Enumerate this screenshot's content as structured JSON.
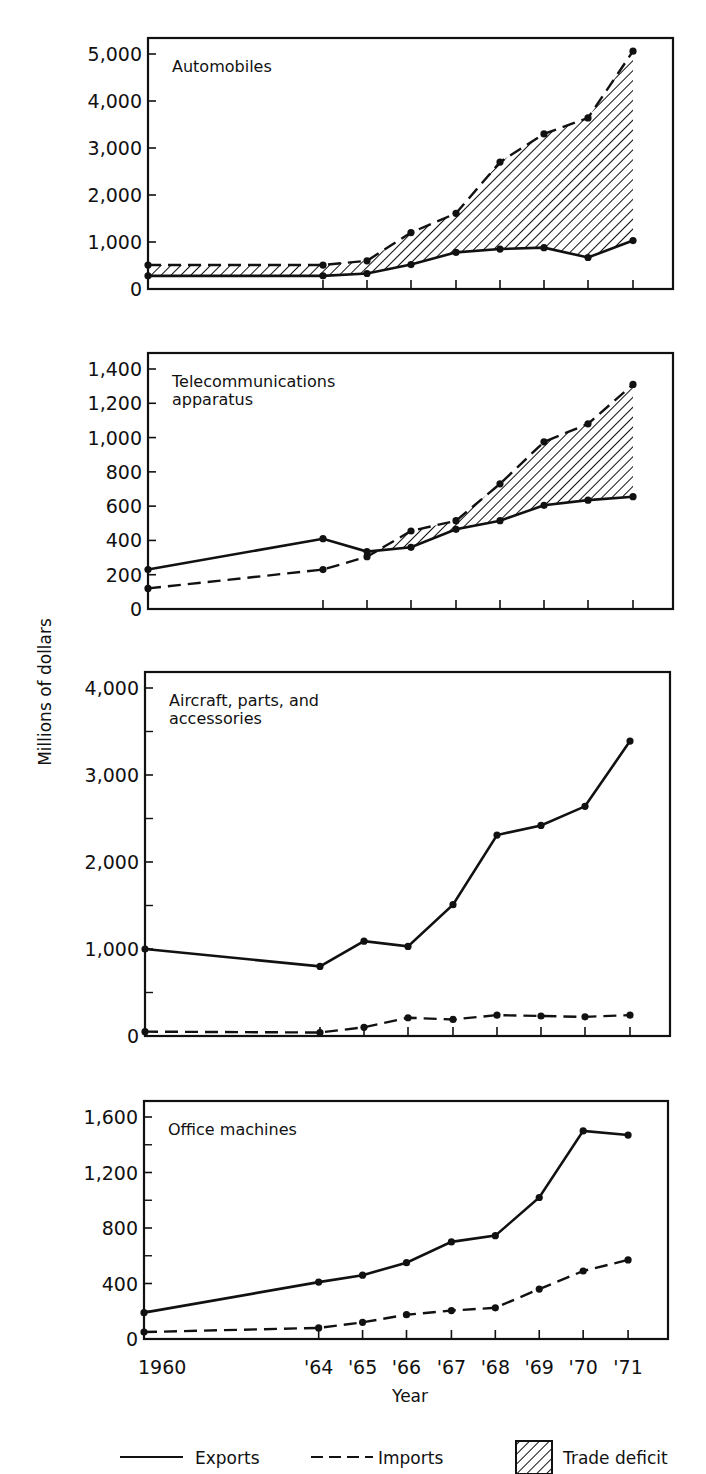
{
  "figure": {
    "ylabel": "Millions of dollars",
    "xlabel": "Year",
    "x_tick_labels": [
      "1960",
      "'64",
      "'65",
      "'66",
      "'67",
      "'68",
      "'69",
      "'70",
      "'71"
    ],
    "legend": {
      "exports": "Exports",
      "imports": "Imports",
      "deficit": "Trade deficit"
    }
  },
  "chart_data": [
    {
      "type": "line",
      "title": "Automobiles",
      "xlabel": "Year",
      "ylabel": "Millions of dollars",
      "x": [
        1960,
        1964,
        1965,
        1966,
        1967,
        1968,
        1969,
        1970,
        1971
      ],
      "ylim": [
        0,
        5000
      ],
      "yticks": [
        0,
        1000,
        2000,
        3000,
        4000,
        5000
      ],
      "ytick_labels": [
        "0",
        "1,000",
        "2,000",
        "3,000",
        "4,000",
        "5,000"
      ],
      "minor_yticks": [],
      "shade_deficit": true,
      "series": [
        {
          "name": "Exports",
          "style": "solid",
          "values": [
            280,
            280,
            330,
            520,
            780,
            850,
            880,
            670,
            1030
          ]
        },
        {
          "name": "Imports",
          "style": "dashed",
          "values": [
            510,
            510,
            600,
            1200,
            1610,
            2700,
            3300,
            3640,
            5060
          ]
        }
      ]
    },
    {
      "type": "line",
      "title": "Telecommunications apparatus",
      "title_lines": [
        "Telecommunications",
        "apparatus"
      ],
      "xlabel": "Year",
      "ylabel": "Millions of dollars",
      "x": [
        1960,
        1964,
        1965,
        1966,
        1967,
        1968,
        1969,
        1970,
        1971
      ],
      "ylim": [
        0,
        1400
      ],
      "yticks": [
        0,
        200,
        400,
        600,
        800,
        1000,
        1200,
        1400
      ],
      "ytick_labels": [
        "0",
        "200",
        "400",
        "600",
        "800",
        "1,000",
        "1,200",
        "1,400"
      ],
      "minor_yticks": [],
      "shade_deficit": true,
      "series": [
        {
          "name": "Exports",
          "style": "solid",
          "values": [
            230,
            410,
            335,
            360,
            465,
            515,
            605,
            635,
            655
          ]
        },
        {
          "name": "Imports",
          "style": "dashed",
          "values": [
            120,
            230,
            305,
            455,
            515,
            730,
            975,
            1080,
            1310
          ]
        }
      ]
    },
    {
      "type": "line",
      "title": "Aircraft, parts, and accessories",
      "title_lines": [
        "Aircraft, parts, and",
        "accessories"
      ],
      "xlabel": "Year",
      "ylabel": "Millions of dollars",
      "x": [
        1960,
        1964,
        1965,
        1966,
        1967,
        1968,
        1969,
        1970,
        1971
      ],
      "ylim": [
        0,
        4000
      ],
      "yticks": [
        0,
        1000,
        2000,
        3000,
        4000
      ],
      "ytick_labels": [
        "0",
        "1,000",
        "2,000",
        "3,000",
        "4,000"
      ],
      "minor_yticks": [
        500,
        1500,
        2500,
        3500
      ],
      "shade_deficit": false,
      "series": [
        {
          "name": "Exports",
          "style": "solid",
          "values": [
            1000,
            800,
            1090,
            1030,
            1510,
            2310,
            2420,
            2640,
            3390
          ]
        },
        {
          "name": "Imports",
          "style": "dashed",
          "values": [
            50,
            40,
            100,
            210,
            190,
            240,
            230,
            220,
            240
          ]
        }
      ]
    },
    {
      "type": "line",
      "title": "Office machines",
      "xlabel": "Year",
      "ylabel": "Millions of dollars",
      "x": [
        1960,
        1964,
        1965,
        1966,
        1967,
        1968,
        1969,
        1970,
        1971
      ],
      "ylim": [
        0,
        1600
      ],
      "yticks": [
        0,
        400,
        800,
        1200,
        1600
      ],
      "ytick_labels": [
        "0",
        "400",
        "800",
        "1,200",
        "1,600"
      ],
      "minor_yticks": [
        200,
        600,
        1000,
        1400
      ],
      "shade_deficit": false,
      "series": [
        {
          "name": "Exports",
          "style": "solid",
          "values": [
            190,
            410,
            460,
            550,
            700,
            745,
            1020,
            1500,
            1470
          ]
        },
        {
          "name": "Imports",
          "style": "dashed",
          "values": [
            50,
            80,
            120,
            175,
            205,
            225,
            360,
            490,
            570
          ]
        }
      ]
    }
  ]
}
